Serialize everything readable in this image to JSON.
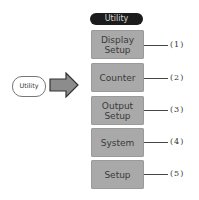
{
  "key": {
    "label": "Utility"
  },
  "arrow": {
    "icon": "right-arrow-icon",
    "color": "#8c8c8c"
  },
  "menu": {
    "title": "Utility",
    "items": [
      {
        "label_line1": "Display",
        "label_line2": "Setup",
        "ref": "(1)"
      },
      {
        "label_line1": "Counter",
        "label_line2": "",
        "ref": "(2)"
      },
      {
        "label_line1": "Output",
        "label_line2": "Setup",
        "ref": "(3)"
      },
      {
        "label_line1": "System",
        "label_line2": "",
        "ref": "(4)"
      },
      {
        "label_line1": "Setup",
        "label_line2": "",
        "ref": "(5)"
      }
    ]
  },
  "colors": {
    "button_bg": "#a9a9a9",
    "header_bg": "#1c1c1c"
  }
}
